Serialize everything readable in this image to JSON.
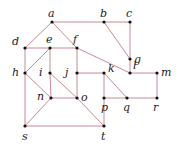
{
  "graph": {
    "colors": {
      "edge": "#c98a93",
      "node": "#111111",
      "label": "#222222"
    },
    "nodes": [
      {
        "id": "a",
        "label": "a"
      },
      {
        "id": "b",
        "label": "b"
      },
      {
        "id": "c",
        "label": "c"
      },
      {
        "id": "d",
        "label": "d"
      },
      {
        "id": "e",
        "label": "e"
      },
      {
        "id": "f",
        "label": "f"
      },
      {
        "id": "g",
        "label": "g"
      },
      {
        "id": "h",
        "label": "h"
      },
      {
        "id": "i",
        "label": "i"
      },
      {
        "id": "j",
        "label": "j"
      },
      {
        "id": "k",
        "label": "k"
      },
      {
        "id": "l",
        "label": "l"
      },
      {
        "id": "m",
        "label": "m"
      },
      {
        "id": "n",
        "label": "n"
      },
      {
        "id": "o",
        "label": "o"
      },
      {
        "id": "p",
        "label": "p"
      },
      {
        "id": "q",
        "label": "q"
      },
      {
        "id": "r",
        "label": "r"
      },
      {
        "id": "s",
        "label": "s"
      },
      {
        "id": "t",
        "label": "t"
      }
    ],
    "edges": [
      [
        "a",
        "b"
      ],
      [
        "b",
        "c"
      ],
      [
        "a",
        "d"
      ],
      [
        "a",
        "f"
      ],
      [
        "b",
        "g"
      ],
      [
        "c",
        "g"
      ],
      [
        "g",
        "l"
      ],
      [
        "d",
        "e"
      ],
      [
        "e",
        "f"
      ],
      [
        "d",
        "h"
      ],
      [
        "e",
        "h"
      ],
      [
        "e",
        "i"
      ],
      [
        "f",
        "l"
      ],
      [
        "f",
        "j"
      ],
      [
        "h",
        "n"
      ],
      [
        "h",
        "s"
      ],
      [
        "i",
        "n"
      ],
      [
        "i",
        "o"
      ],
      [
        "n",
        "o"
      ],
      [
        "n",
        "s"
      ],
      [
        "j",
        "k"
      ],
      [
        "j",
        "o"
      ],
      [
        "k",
        "p"
      ],
      [
        "k",
        "q"
      ],
      [
        "p",
        "q"
      ],
      [
        "l",
        "m"
      ],
      [
        "m",
        "r"
      ],
      [
        "q",
        "r"
      ],
      [
        "s",
        "t"
      ],
      [
        "o",
        "t"
      ],
      [
        "p",
        "t"
      ]
    ]
  }
}
